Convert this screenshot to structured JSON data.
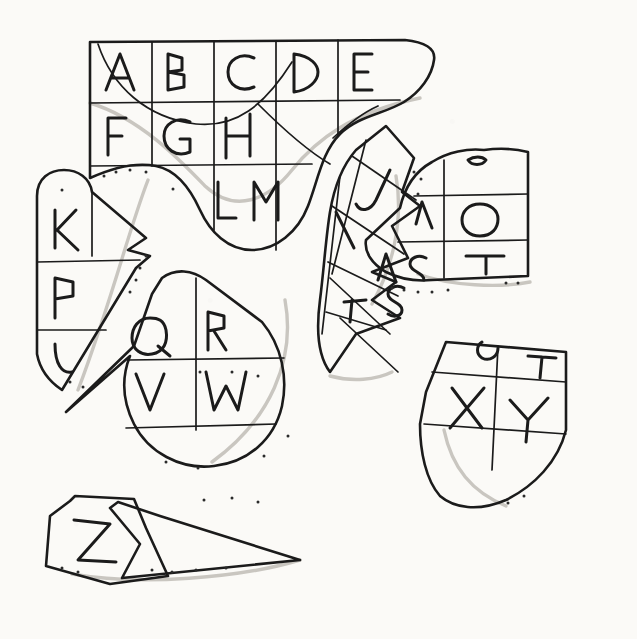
{
  "image": {
    "title": "Hand-drawn torn alphabet grid puzzle",
    "medium": "black ink line drawing on cream paper",
    "background_color": "#fbfaf7",
    "ink_color": "#1b1b1b",
    "shadow_color": "#c9c6c0",
    "width": 637,
    "height": 639
  },
  "letters": {
    "row1": [
      "A",
      "B",
      "C",
      "D",
      "E"
    ],
    "row2": [
      "F",
      "G",
      "H",
      "I",
      "J"
    ],
    "row3": [
      "K",
      "L",
      "M",
      "N",
      "O"
    ],
    "row4": [
      "P",
      "Q",
      "R",
      "S",
      "T"
    ],
    "row5": [
      "U",
      "V",
      "W",
      "X",
      "Y"
    ],
    "extra": [
      "Z"
    ]
  },
  "pieces": [
    {
      "name": "top-band-piece",
      "letters": [
        "A",
        "B",
        "C",
        "D",
        "E",
        "F",
        "G",
        "H",
        "L",
        "M"
      ],
      "edge": "curved-wave-bottom"
    },
    {
      "name": "left-column-piece",
      "letters": [
        "K",
        "P",
        "U"
      ],
      "edge": "rounded-top-diagonal-right"
    },
    {
      "name": "teardrop-piece",
      "letters": [
        "Q",
        "R",
        "V",
        "W"
      ],
      "edge": "teardrop-round-bottom"
    },
    {
      "name": "warped-strip-piece",
      "letters": [
        "I",
        "J",
        "N",
        "R",
        "S"
      ],
      "edge": "folded-curled-strip"
    },
    {
      "name": "right-block-piece",
      "letters": [
        "N",
        "O",
        "S",
        "T"
      ],
      "edge": "straight-right-curved-left"
    },
    {
      "name": "shield-piece",
      "letters": [
        "S",
        "T",
        "X",
        "Y"
      ],
      "edge": "shield-rounded-bottom"
    },
    {
      "name": "z-sliver-piece",
      "letters": [
        "Z"
      ],
      "edge": "thin-triangular-sliver"
    }
  ]
}
